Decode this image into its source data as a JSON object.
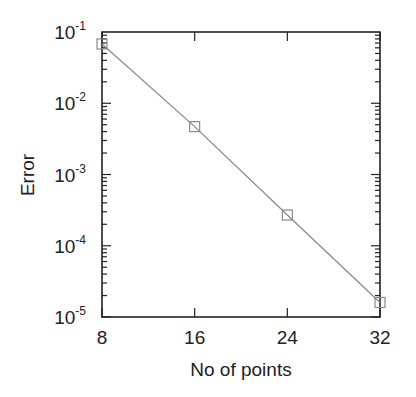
{
  "chart_data": {
    "type": "line",
    "title": "",
    "xlabel": "No of points",
    "ylabel": "Error",
    "xscale": "linear",
    "yscale": "log",
    "xlim": [
      8,
      32
    ],
    "ylim": [
      1e-05,
      0.1
    ],
    "x_ticks": [
      8,
      16,
      24,
      32
    ],
    "x_tick_labels": [
      "8",
      "16",
      "24",
      "32"
    ],
    "y_ticks": [
      0.1,
      0.01,
      0.001,
      0.0001,
      1e-05
    ],
    "y_tick_labels": [
      {
        "base": "10",
        "exp": "-1"
      },
      {
        "base": "10",
        "exp": "-2"
      },
      {
        "base": "10",
        "exp": "-3"
      },
      {
        "base": "10",
        "exp": "-4"
      },
      {
        "base": "10",
        "exp": "-5"
      }
    ],
    "grid": false,
    "legend": null,
    "series": [
      {
        "name": "Error",
        "marker": "open-square",
        "line_color": "#8a8a8a",
        "marker_color": "#8a8a8a",
        "x": [
          8,
          16,
          24,
          32
        ],
        "values": [
          0.068,
          0.0047,
          0.00027,
          1.6e-05
        ]
      }
    ]
  },
  "colors": {
    "axis": "#222222",
    "line": "#8a8a8a",
    "background": "#ffffff"
  }
}
